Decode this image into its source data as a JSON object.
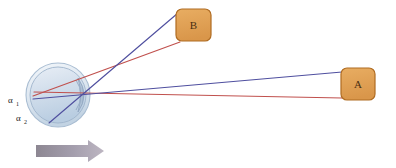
{
  "figure": {
    "background": "#ffffff"
  },
  "eye": {
    "name": "eye-schematic",
    "center_x": 58,
    "center_y": 95,
    "radius": 29,
    "outer_ring_color": "#aebfd4",
    "sclera_fill_top": "#dde6f0",
    "sclera_fill_bottom": "#c6d6e6",
    "cornea_color": "#9fb4cc",
    "nodal_point": {
      "x": 86,
      "y": 94
    }
  },
  "angles": [
    {
      "id": "alpha-1",
      "symbol": "α",
      "subscript": "1",
      "x": 10,
      "y": 100
    },
    {
      "id": "alpha-2",
      "symbol": "α",
      "subscript": "2",
      "x": 18,
      "y": 118
    }
  ],
  "targets": [
    {
      "id": "target-b",
      "label": "B",
      "x": 176,
      "y": 9,
      "width": 35,
      "height": 32,
      "fill": "#e0a055",
      "stroke": "#b06c22",
      "text_color": "#4a2f12"
    },
    {
      "id": "target-a",
      "label": "A",
      "x": 341,
      "y": 68,
      "width": 34,
      "height": 32,
      "fill": "#e0a055",
      "stroke": "#b06c22",
      "text_color": "#4a2f12"
    }
  ],
  "rays": [
    {
      "id": "ray-blue-to-b",
      "color": "#4f4f9f",
      "from": {
        "x": 49,
        "y": 123
      },
      "to": {
        "x": 178,
        "y": 13
      }
    },
    {
      "id": "ray-red-to-b",
      "color": "#c0504d",
      "from": {
        "x": 33,
        "y": 96
      },
      "to": {
        "x": 180,
        "y": 42
      }
    },
    {
      "id": "ray-blue-to-a",
      "color": "#4f4f9f",
      "from": {
        "x": 33,
        "y": 99
      },
      "to": {
        "x": 342,
        "y": 72
      }
    },
    {
      "id": "ray-red-to-a",
      "color": "#c0504d",
      "from": {
        "x": 34,
        "y": 92
      },
      "to": {
        "x": 342,
        "y": 98
      }
    }
  ],
  "motion_arrow": {
    "name": "motion-direction-arrow",
    "x": 36,
    "y": 145,
    "length": 68,
    "thickness": 11,
    "head_length": 16,
    "head_thickness": 22,
    "color_start": "#8d8792",
    "color_end": "#b9b2bd",
    "direction": "right"
  }
}
